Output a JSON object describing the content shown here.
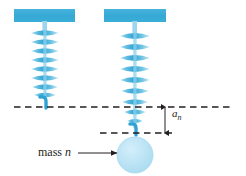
{
  "figure": {
    "background_color": "#ffffff",
    "width": 246,
    "height": 176
  },
  "colors": {
    "support_bar": "#3aaed8",
    "spring_dark": "#33a6d4",
    "spring_mid": "#63c1e2",
    "spring_light": "#a9dcf0",
    "mass_fill": "#b9e3f4",
    "mass_stroke": "#a3d9ef",
    "line_dark": "#231f20",
    "text": "#231f20"
  },
  "labels": {
    "mass": {
      "text_prefix": "mass ",
      "symbol": "n",
      "full": "mass n"
    },
    "extension": {
      "symbol": "a",
      "subscript": "n",
      "full": "a_n"
    }
  },
  "elements": {
    "support_bar_left": {
      "name": "ceiling support (unloaded spring)",
      "x": 14,
      "y": 9,
      "width": 61,
      "height": 13
    },
    "support_bar_right": {
      "name": "ceiling support (loaded spring)",
      "x": 104,
      "y": 9,
      "width": 62,
      "height": 13
    },
    "spring_left": {
      "name": "unstretched spring",
      "center_x": 45,
      "top_y": 22,
      "bottom_y": 107,
      "coils": 8,
      "state": "natural length"
    },
    "spring_right": {
      "name": "stretched spring",
      "center_x": 135,
      "top_y": 22,
      "bottom_y": 133,
      "coils": 9,
      "state": "stretched by hanging mass"
    },
    "reference_line_upper": {
      "name": "natural-length reference line",
      "y": 107,
      "x_start": 14,
      "x_end": 231,
      "style": "dashed"
    },
    "reference_line_lower": {
      "name": "stretched-length reference line",
      "y": 133,
      "x_start": 100,
      "x_end": 172,
      "style": "dashed"
    },
    "dimension_line": {
      "name": "extension dimension line",
      "x": 165,
      "y_top": 107,
      "y_bottom": 133,
      "arrowheads": "both ends",
      "measures": "a_n"
    },
    "mass_circle": {
      "name": "hanging mass n",
      "center_x": 135,
      "center_y": 155,
      "radius": 18
    },
    "callout_arrow": {
      "name": "mass label leader arrow",
      "x_start": 78,
      "x_end": 117,
      "y": 153,
      "points_to": "mass_circle"
    }
  },
  "physics": {
    "quantity_shown": "a_n",
    "meaning": "extension of spring n under mass n",
    "left_diagram": "spring at natural length (no mass attached)",
    "right_diagram": "spring extended by distance a_n with mass n attached"
  }
}
